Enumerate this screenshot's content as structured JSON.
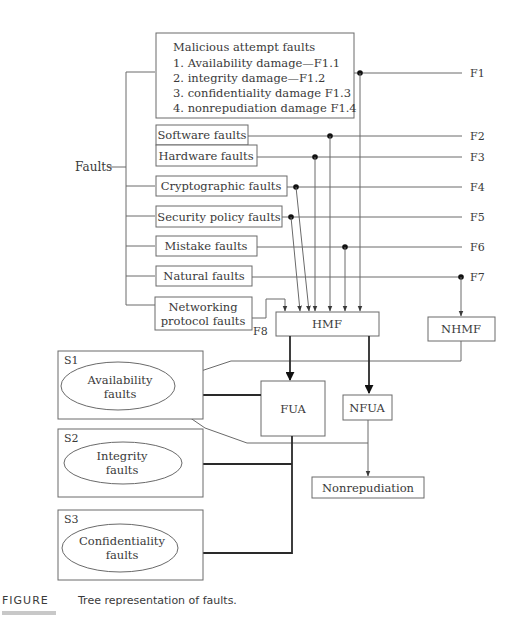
{
  "root": {
    "label": "Faults"
  },
  "malicious": {
    "title": "Malicious attempt faults",
    "items": [
      "1. Availability damage—F1.1",
      "2. integrity damage—F1.2",
      "3. confidentiality damage F1.3",
      "4. nonrepudiation damage F1.4"
    ]
  },
  "fault_boxes": [
    {
      "label": "Software faults",
      "code": "F2"
    },
    {
      "label": "Hardware faults",
      "code": "F3"
    },
    {
      "label": "Cryptographic faults",
      "code": "F4"
    },
    {
      "label": "Security policy faults",
      "code": "F5"
    },
    {
      "label": "Mistake faults",
      "code": "F6"
    },
    {
      "label": "Natural faults",
      "code": "F7"
    }
  ],
  "networking": {
    "line1": "Networking",
    "line2": "protocol faults",
    "code": "F8"
  },
  "f1_code": "F1",
  "nodes": {
    "hmf": "HMF",
    "nhmf": "NHMF",
    "fua": "FUA",
    "nfua": "NFUA",
    "nonrepudiation": "Nonrepudiation"
  },
  "groups": [
    {
      "id": "S1",
      "line1": "Availability",
      "line2": "faults"
    },
    {
      "id": "S2",
      "line1": "Integrity",
      "line2": "faults"
    },
    {
      "id": "S3",
      "line1": "Confidentiality",
      "line2": "faults"
    }
  ],
  "caption": {
    "label": "FIGURE",
    "text": "Tree representation of faults."
  }
}
